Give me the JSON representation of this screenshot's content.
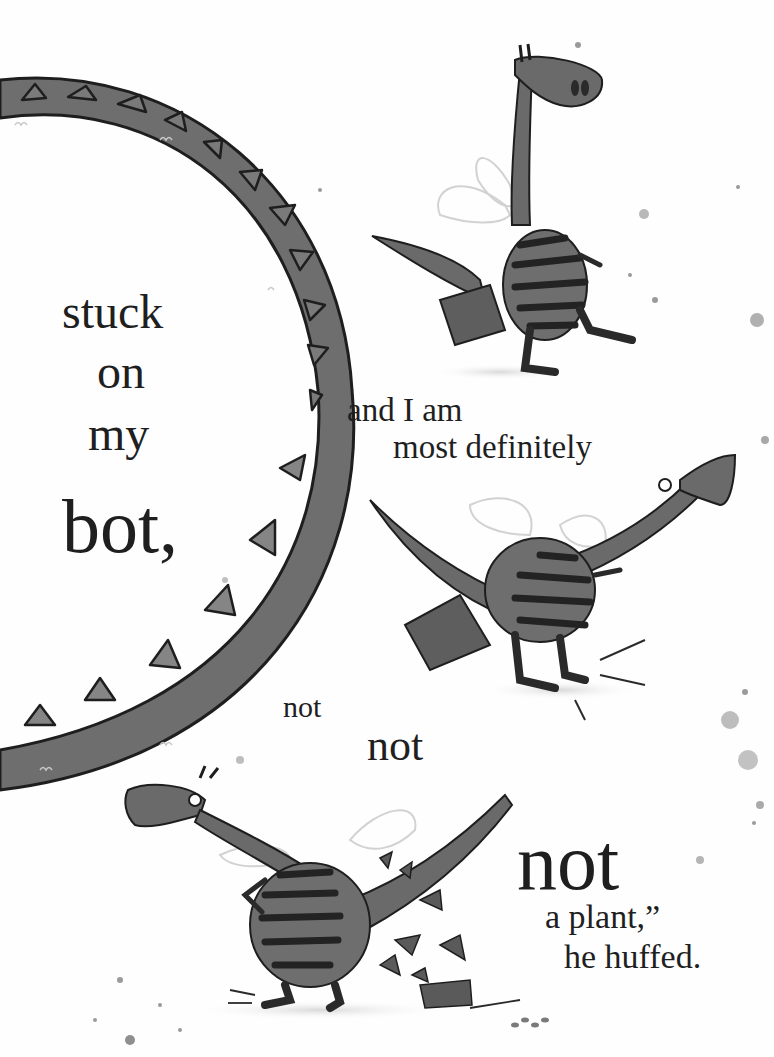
{
  "page": {
    "background": "#fefefe",
    "ink": "#1f1f1f",
    "illustration_gray": "#6a6a6a",
    "stripe_dark": "#262626"
  },
  "text_blocks": {
    "left_column": {
      "line1": "stuck",
      "line2": "on",
      "line3": "my",
      "line4": "bot,"
    },
    "middle": {
      "line1": "and I am",
      "line2": "most definitely"
    },
    "nots": {
      "small": "not",
      "medium": "not",
      "large": "not"
    },
    "ending": {
      "line1": "a plant,”",
      "line2": "he huffed."
    }
  },
  "illustrations": [
    {
      "name": "dragon-tail-arc",
      "description": "large curved spiky dragon tail forming a C-shape on the left"
    },
    {
      "name": "dragon-hopping",
      "description": "striped dragon hopping on one leg with a pot stuck on its bottom"
    },
    {
      "name": "dragon-leaning",
      "description": "striped dragon leaning forward with pot on its bottom"
    },
    {
      "name": "dragon-pot-broken",
      "description": "striped dragon with hands on hips, broken pot shards at its feet"
    }
  ]
}
